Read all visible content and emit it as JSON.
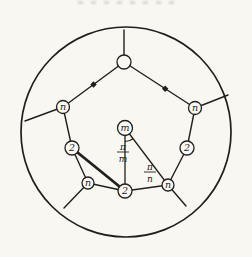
{
  "figure": {
    "description_labels": {
      "node_labels_used": [
        "n",
        "2",
        "m"
      ],
      "angle_labels_used": [
        "π/m",
        "π/n"
      ]
    },
    "ink": "#211f1c",
    "paper": "#f8f7f2",
    "node_fill": "#f8f7f2",
    "outer_circle": {
      "cx": 126,
      "cy": 132,
      "r": 105
    },
    "nodes": [
      {
        "id": "top",
        "x": 124,
        "y": 62,
        "r": 7,
        "label": ""
      },
      {
        "id": "upper-left-n",
        "x": 63,
        "y": 107,
        "r": 6.5,
        "label": "n"
      },
      {
        "id": "upper-right-n",
        "x": 195,
        "y": 108,
        "r": 6.5,
        "label": "n"
      },
      {
        "id": "left-2",
        "x": 72,
        "y": 148,
        "r": 7,
        "label": "2"
      },
      {
        "id": "right-2",
        "x": 187,
        "y": 148,
        "r": 7,
        "label": "2"
      },
      {
        "id": "lower-left-n",
        "x": 88,
        "y": 183,
        "r": 6,
        "label": "n"
      },
      {
        "id": "lower-right-n",
        "x": 168,
        "y": 185,
        "r": 6,
        "label": "n"
      },
      {
        "id": "bottom-2",
        "x": 125,
        "y": 191,
        "r": 7,
        "label": "2"
      },
      {
        "id": "center-m",
        "x": 125,
        "y": 128,
        "r": 7.5,
        "label": "m"
      }
    ],
    "stubs": [
      {
        "id": "top-up",
        "x1": 124,
        "y1": 62,
        "x2": 124,
        "y2": 30
      },
      {
        "id": "upper-left",
        "x1": 63,
        "y1": 107,
        "x2": 25,
        "y2": 121
      },
      {
        "id": "upper-right",
        "x1": 195,
        "y1": 108,
        "x2": 228,
        "y2": 95
      },
      {
        "id": "lower-left",
        "x1": 88,
        "y1": 183,
        "x2": 64,
        "y2": 208
      },
      {
        "id": "lower-right",
        "x1": 168,
        "y1": 185,
        "x2": 186,
        "y2": 206
      }
    ],
    "edges": [
      {
        "from": "top",
        "to": "upper-left-n",
        "w": 1.4
      },
      {
        "from": "top",
        "to": "upper-right-n",
        "w": 1.4
      },
      {
        "from": "upper-left-n",
        "to": "left-2",
        "w": 1.4
      },
      {
        "from": "left-2",
        "to": "lower-left-n",
        "w": 1.4
      },
      {
        "from": "lower-left-n",
        "to": "bottom-2",
        "w": 1.4
      },
      {
        "from": "bottom-2",
        "to": "lower-right-n",
        "w": 1.4
      },
      {
        "from": "lower-right-n",
        "to": "right-2",
        "w": 1.4
      },
      {
        "from": "right-2",
        "to": "upper-right-n",
        "w": 1.4
      },
      {
        "from": "center-m",
        "to": "bottom-2",
        "w": 1.3
      },
      {
        "from": "center-m",
        "to": "lower-right-n",
        "w": 1.3
      },
      {
        "from": "left-2",
        "to": "bottom-2",
        "w": 2.8
      }
    ],
    "edge_dots": [
      {
        "edge_from": "top",
        "edge_to": "upper-left-n",
        "t": 0.5
      },
      {
        "edge_from": "top",
        "edge_to": "upper-right-n",
        "t": 0.58
      }
    ],
    "angle_arc": {
      "path": "M 125 141.5 A 13.5 13.5 0 0 0 133.1 138.8"
    },
    "fraction_labels": [
      {
        "id": "pi-over-m",
        "numerator": "π",
        "denominator": "m",
        "cx": 123,
        "bar_y": 152,
        "half": 6
      },
      {
        "id": "pi-over-n",
        "numerator": "π",
        "denominator": "n",
        "cx": 150,
        "bar_y": 172,
        "half": 6
      }
    ]
  }
}
